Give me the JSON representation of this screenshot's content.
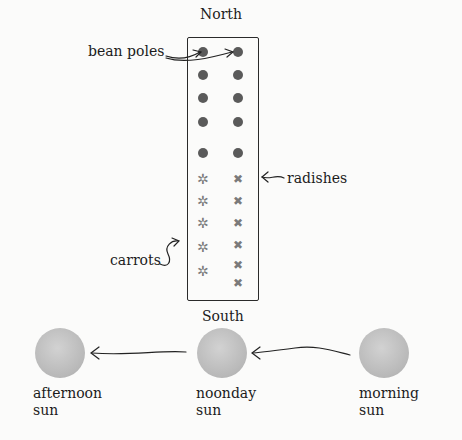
{
  "diagram": {
    "north_label": "North",
    "south_label": "South",
    "bed": {
      "bean_poles_label": "bean poles",
      "radishes_label": "radishes",
      "carrots_label": "carrots",
      "bean_pole_rows": 5,
      "plant_rows": 5
    },
    "suns": [
      {
        "label_line1": "afternoon",
        "label_line2": "sun"
      },
      {
        "label_line1": "noonday",
        "label_line2": "sun"
      },
      {
        "label_line1": "morning",
        "label_line2": "sun"
      }
    ],
    "icons": {
      "carrot_glyph": "✲",
      "radish_glyph": "✖"
    },
    "colors": {
      "background": "#fbfbfa",
      "pole": "#5a5a5a",
      "sun": "#bdbdbd",
      "ink": "#1c1c1c"
    }
  }
}
